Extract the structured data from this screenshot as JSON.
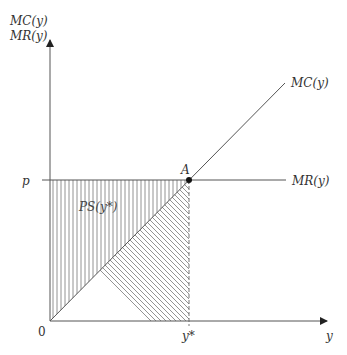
{
  "diagram": {
    "y_axis_label_line1": "MC(y)",
    "y_axis_label_line2": "MR(y)",
    "x_axis_label": "y",
    "origin_label": "0",
    "price_label": "p",
    "equilibrium_quantity_label": "y*",
    "point_label": "A",
    "mc_curve_label": "MC(y)",
    "mr_curve_label": "MR(y)",
    "surplus_label": "PS(y*)"
  },
  "colors": {
    "axis": "#555555",
    "hatch": "#777777",
    "text": "#333333"
  }
}
